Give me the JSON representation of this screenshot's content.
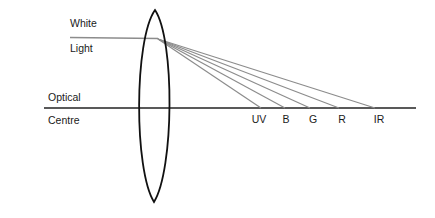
{
  "diagram": {
    "labels": {
      "white": "White",
      "light": "Light",
      "optical": "Optical",
      "centre": "Centre"
    },
    "colors": {
      "lens": "#111111",
      "axis": "#222222",
      "rays": "#8c8c8c",
      "text": "#1a1a1a",
      "background": "#ffffff"
    },
    "focal_points": [
      {
        "label": "UV",
        "x": 261
      },
      {
        "label": "B",
        "x": 285
      },
      {
        "label": "G",
        "x": 310
      },
      {
        "label": "R",
        "x": 339
      },
      {
        "label": "IR",
        "x": 375
      }
    ]
  }
}
